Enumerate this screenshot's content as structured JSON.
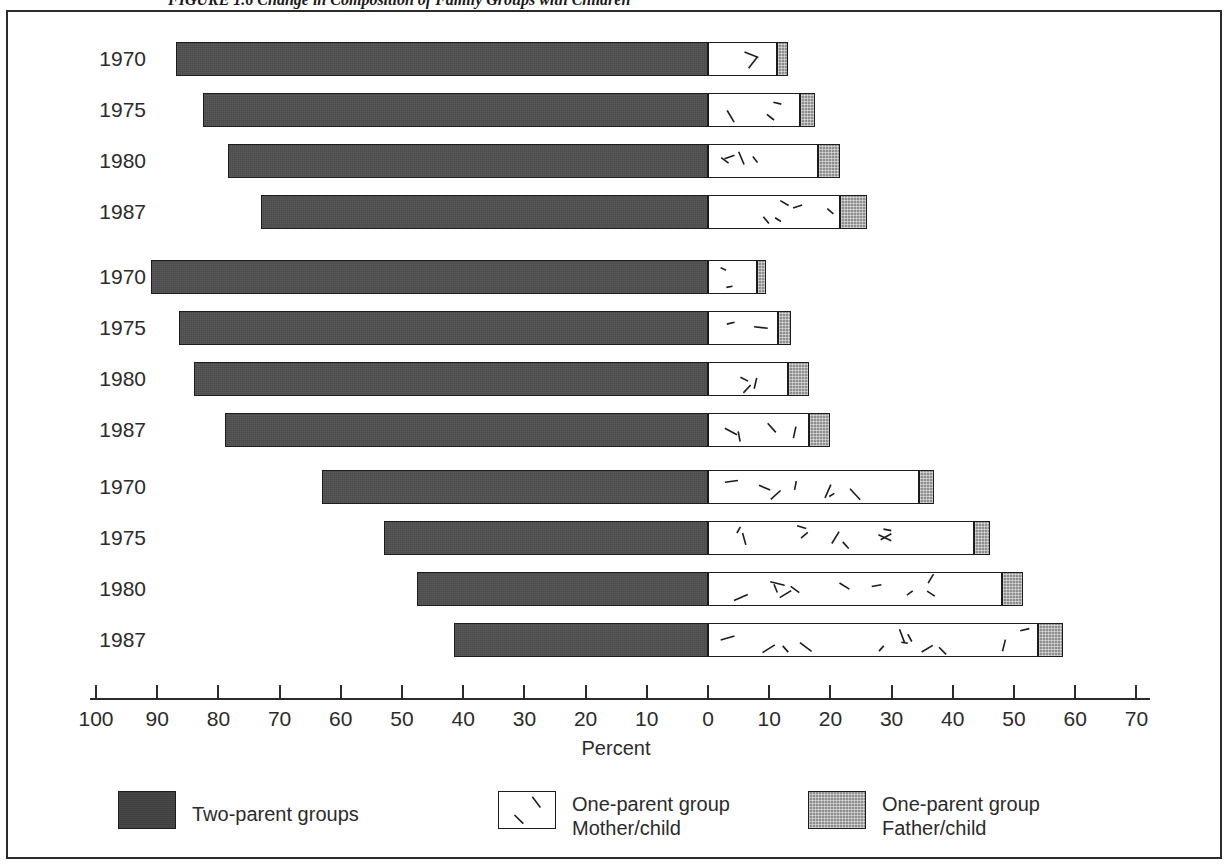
{
  "figure": {
    "caption": "FIGURE 1.6  Change in Composition of Family Groups with Children"
  },
  "axis": {
    "title": "Percent",
    "tick_labels": [
      "100",
      "90",
      "80",
      "70",
      "60",
      "50",
      "40",
      "30",
      "20",
      "10",
      "0",
      "10",
      "20",
      "30",
      "40",
      "50",
      "60",
      "70"
    ],
    "tick_values": [
      -100,
      -90,
      -80,
      -70,
      -60,
      -50,
      -40,
      -30,
      -20,
      -10,
      0,
      10,
      20,
      30,
      40,
      50,
      60,
      70
    ],
    "left_max": 100,
    "right_max": 70
  },
  "legend": {
    "items": [
      {
        "name": "two-parent",
        "label_line1": "Two-parent groups",
        "label_line2": "",
        "color": "#3f3f3f"
      },
      {
        "name": "mother-child",
        "label_line1": "One-parent group",
        "label_line2": "Mother/child",
        "color": "#ffffff"
      },
      {
        "name": "father-child",
        "label_line1": "One-parent group",
        "label_line2": "Father/child",
        "color": "#8e8e8e"
      }
    ]
  },
  "chart_data": {
    "type": "bar",
    "orientation": "horizontal",
    "stacked": true,
    "title": "FIGURE 1.6  Change in Composition of Family Groups with Children",
    "xlabel": "Percent",
    "ylabel": "",
    "xlim": [
      -100,
      70
    ],
    "grid": false,
    "legend_position": "bottom",
    "series": [
      {
        "name": "Two-parent groups",
        "color": "#3f3f3f",
        "direction": "left"
      },
      {
        "name": "One-parent group Mother/child",
        "color": "#ffffff",
        "direction": "right"
      },
      {
        "name": "One-parent group Father/child",
        "color": "#8e8e8e",
        "direction": "right"
      }
    ],
    "groups": [
      {
        "name": "group-1",
        "categories": [
          "1970",
          "1975",
          "1980",
          "1987"
        ],
        "rows": [
          {
            "year": "1970",
            "two_parent": 87.0,
            "mother_child": 11.3,
            "father_child": 1.7
          },
          {
            "year": "1975",
            "two_parent": 82.5,
            "mother_child": 15.0,
            "father_child": 2.5
          },
          {
            "year": "1980",
            "two_parent": 78.5,
            "mother_child": 18.0,
            "father_child": 3.5
          },
          {
            "year": "1987",
            "two_parent": 73.0,
            "mother_child": 21.5,
            "father_child": 4.5
          }
        ]
      },
      {
        "name": "group-2",
        "categories": [
          "1970",
          "1975",
          "1980",
          "1987"
        ],
        "rows": [
          {
            "year": "1970",
            "two_parent": 91.0,
            "mother_child": 8.0,
            "father_child": 1.5
          },
          {
            "year": "1975",
            "two_parent": 86.5,
            "mother_child": 11.5,
            "father_child": 2.0
          },
          {
            "year": "1980",
            "two_parent": 84.0,
            "mother_child": 13.0,
            "father_child": 3.5
          },
          {
            "year": "1987",
            "two_parent": 79.0,
            "mother_child": 16.5,
            "father_child": 3.5
          }
        ]
      },
      {
        "name": "group-3",
        "categories": [
          "1970",
          "1975",
          "1980",
          "1987"
        ],
        "rows": [
          {
            "year": "1970",
            "two_parent": 63.0,
            "mother_child": 34.5,
            "father_child": 2.5
          },
          {
            "year": "1975",
            "two_parent": 53.0,
            "mother_child": 43.5,
            "father_child": 2.5
          },
          {
            "year": "1980",
            "two_parent": 47.5,
            "mother_child": 48.0,
            "father_child": 3.5
          },
          {
            "year": "1987",
            "two_parent": 41.5,
            "mother_child": 54.0,
            "father_child": 4.0
          }
        ]
      }
    ]
  }
}
